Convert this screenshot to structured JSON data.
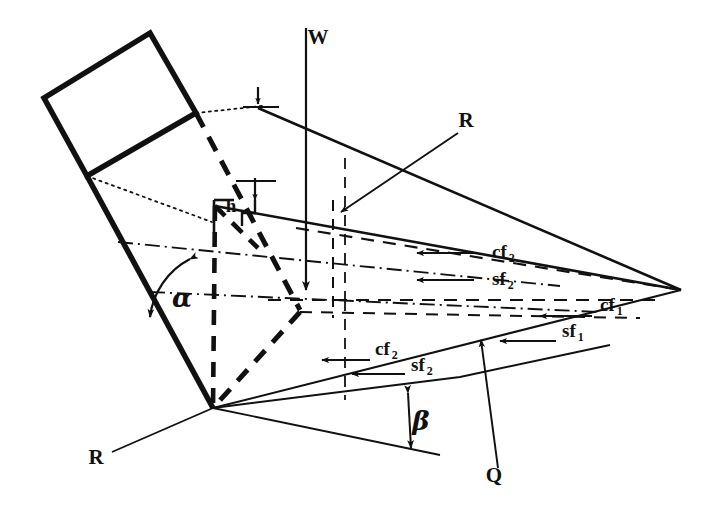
{
  "figure": {
    "type": "engineering-free-body-diagram",
    "background_color": "#ffffff",
    "line_color": "#111111"
  },
  "labels": {
    "weight": "W",
    "reaction_upper": "R",
    "reaction_lower": "R",
    "surcharge": "Q",
    "height": "h",
    "angle_alpha": "α",
    "angle_beta": "β"
  },
  "forces": [
    {
      "id": "cf2-upper",
      "base": "cf",
      "subscript": "2",
      "x": 492,
      "y": 258,
      "arrow_from_x": 474,
      "arrow_from_y": 253,
      "arrow_to_x": 417,
      "arrow_to_y": 253
    },
    {
      "id": "sf2-upper",
      "base": "sf",
      "subscript": "2",
      "x": 492,
      "y": 285,
      "arrow_from_x": 474,
      "arrow_from_y": 280,
      "arrow_to_x": 417,
      "arrow_to_y": 280
    },
    {
      "id": "cf1-right",
      "base": "cf",
      "subscript": "1",
      "x": 600,
      "y": 311,
      "arrow_from_x": 592,
      "arrow_from_y": 316,
      "arrow_to_x": 540,
      "arrow_to_y": 316
    },
    {
      "id": "sf1-right",
      "base": "sf",
      "subscript": "1",
      "x": 562,
      "y": 337,
      "arrow_from_x": 556,
      "arrow_from_y": 341,
      "arrow_to_x": 500,
      "arrow_to_y": 341
    },
    {
      "id": "cf2-lower",
      "base": "cf",
      "subscript": "2",
      "x": 375,
      "y": 355,
      "arrow_from_x": 370,
      "arrow_from_y": 360,
      "arrow_to_x": 322,
      "arrow_to_y": 360
    },
    {
      "id": "sf2-lower",
      "base": "sf",
      "subscript": "2",
      "x": 411,
      "y": 371,
      "arrow_from_x": 405,
      "arrow_from_y": 374,
      "arrow_to_x": 352,
      "arrow_to_y": 374
    }
  ],
  "label_positions": {
    "weight": {
      "x": 318,
      "y": 44
    },
    "reaction_upper": {
      "x": 466,
      "y": 127
    },
    "reaction_lower": {
      "x": 96,
      "y": 464
    },
    "surcharge": {
      "x": 494,
      "y": 482
    },
    "height": {
      "x": 231,
      "y": 212
    },
    "angle_alpha": {
      "x": 182,
      "y": 307
    },
    "angle_beta": {
      "x": 421,
      "y": 430
    }
  },
  "geometry": {
    "slab_top": [
      150,
      33
    ],
    "slab_left": [
      44,
      98
    ],
    "slab_mid": [
      87,
      176
    ],
    "slab_right": [
      196,
      113
    ],
    "apex_bottom": [
      213,
      408
    ],
    "apex_right": [
      681,
      290
    ],
    "wedge_top_left": [
      215,
      103
    ],
    "wedge_crest_right": [
      600,
      195
    ]
  }
}
